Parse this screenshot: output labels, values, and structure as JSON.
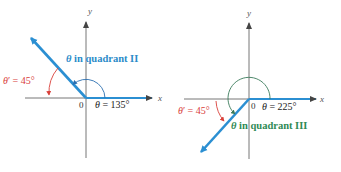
{
  "colors": {
    "terminal_ray": "#2b8fd2",
    "axis": "#666666",
    "reference_angle": "#d9403a",
    "quadrant_ii_label": "#2b8cc9",
    "quadrant_iii_label": "#2f8a55",
    "angle_arc_left": "#2b6fb0",
    "angle_arc_right": "#3a7a5a"
  },
  "left_figure": {
    "x_axis_label": "x",
    "y_axis_label": "y",
    "origin_label": "0",
    "theta_label": "θ = 135°",
    "reference_label": "θ′ = 45°",
    "quadrant_label": "θ in quadrant II"
  },
  "right_figure": {
    "x_axis_label": "x",
    "y_axis_label": "y",
    "origin_label": "0",
    "theta_label": "θ = 225°",
    "reference_label": "θ′ = 45°",
    "quadrant_label": "θ in quadrant III"
  }
}
